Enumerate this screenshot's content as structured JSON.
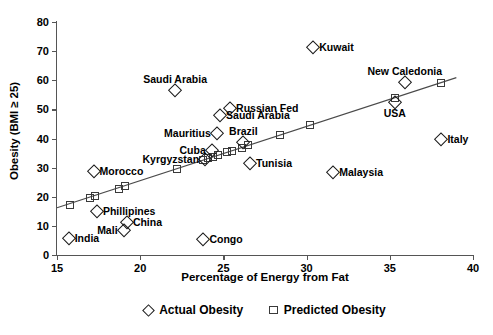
{
  "chart_data": {
    "type": "scatter",
    "title": "",
    "xlabel": "Percentage of Energy from Fat",
    "ylabel": "Obesity (BMI ≥ 25)",
    "xlim": [
      15,
      40
    ],
    "ylim": [
      0,
      80
    ],
    "xticks": [
      15,
      20,
      25,
      30,
      35,
      40
    ],
    "yticks": [
      0,
      10,
      20,
      30,
      40,
      50,
      60,
      70,
      80
    ],
    "grid": false,
    "legend_position": "bottom-center",
    "legend": [
      {
        "label": "Actual Obesity",
        "marker": "diamond"
      },
      {
        "label": "Predicted Obesity",
        "marker": "square"
      }
    ],
    "series": [
      {
        "name": "Actual Obesity",
        "marker": "diamond",
        "points": [
          {
            "label": "India",
            "x": 15.7,
            "y": 5.8,
            "label_pos": "right"
          },
          {
            "label": "Morocco",
            "x": 17.2,
            "y": 28.8,
            "label_pos": "right"
          },
          {
            "label": "Phillipines",
            "x": 17.4,
            "y": 15.0,
            "label_pos": "right"
          },
          {
            "label": "Mali",
            "x": 19.0,
            "y": 8.5,
            "label_pos": "left"
          },
          {
            "label": "China",
            "x": 19.2,
            "y": 11.5,
            "label_pos": "right"
          },
          {
            "label": "Saudi Arabia",
            "x": 22.1,
            "y": 56.5,
            "label_pos": "above"
          },
          {
            "label": "Congo",
            "x": 23.8,
            "y": 5.5,
            "label_pos": "right"
          },
          {
            "label": "Kyrgyzstan",
            "x": 23.9,
            "y": 32.8,
            "label_pos": "left"
          },
          {
            "label": "Cuba",
            "x": 24.3,
            "y": 36.0,
            "label_pos": "left"
          },
          {
            "label": "Mauritius",
            "x": 24.6,
            "y": 42.0,
            "label_pos": "left"
          },
          {
            "label": "Saudi Arabia",
            "x": 24.8,
            "y": 48.0,
            "label_pos": "right"
          },
          {
            "label": "Russian Fed",
            "x": 25.4,
            "y": 50.5,
            "label_pos": "right"
          },
          {
            "label": "Brazil",
            "x": 26.2,
            "y": 38.8,
            "label_pos": "above"
          },
          {
            "label": "Tunisia",
            "x": 26.6,
            "y": 31.5,
            "label_pos": "right"
          },
          {
            "label": "Kuwait",
            "x": 30.4,
            "y": 71.5,
            "label_pos": "right"
          },
          {
            "label": "Malaysia",
            "x": 31.6,
            "y": 28.5,
            "label_pos": "right"
          },
          {
            "label": "USA",
            "x": 35.3,
            "y": 52.5,
            "label_pos": "below"
          },
          {
            "label": "New Caledonia",
            "x": 35.9,
            "y": 59.5,
            "label_pos": "above"
          },
          {
            "label": "Italy",
            "x": 38.1,
            "y": 39.8,
            "label_pos": "right"
          }
        ]
      },
      {
        "name": "Predicted Obesity",
        "marker": "square",
        "points": [
          {
            "x": 15.8,
            "y": 17.2
          },
          {
            "x": 17.0,
            "y": 19.5
          },
          {
            "x": 17.3,
            "y": 20.2
          },
          {
            "x": 18.7,
            "y": 22.6
          },
          {
            "x": 19.1,
            "y": 23.6
          },
          {
            "x": 22.2,
            "y": 29.4
          },
          {
            "x": 23.8,
            "y": 32.6
          },
          {
            "x": 24.1,
            "y": 33.2
          },
          {
            "x": 24.4,
            "y": 33.7
          },
          {
            "x": 24.7,
            "y": 34.2
          },
          {
            "x": 25.2,
            "y": 35.2
          },
          {
            "x": 25.5,
            "y": 35.7
          },
          {
            "x": 26.1,
            "y": 36.9
          },
          {
            "x": 26.5,
            "y": 37.6
          },
          {
            "x": 28.4,
            "y": 41.3
          },
          {
            "x": 30.2,
            "y": 44.6
          },
          {
            "x": 35.3,
            "y": 54.0
          },
          {
            "x": 38.1,
            "y": 59.2
          }
        ]
      }
    ],
    "trendline": {
      "x1": 15.0,
      "y1": 16.2,
      "x2": 39.0,
      "y2": 60.9
    }
  }
}
